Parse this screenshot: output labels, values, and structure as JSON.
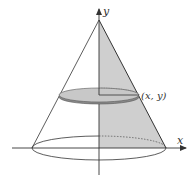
{
  "diagram": {
    "axes": {
      "x_label": "x",
      "y_label": "y"
    },
    "point_label": "(x, y)",
    "colors": {
      "stroke": "#333333",
      "shade": "#cfcfcf",
      "disk_fill": "#c8c8c8",
      "disk_edge": "#7a7a7a",
      "background": "#ffffff"
    },
    "geometry": {
      "apex": [
        99,
        20
      ],
      "base_center": [
        99,
        148
      ],
      "base_rx": 67,
      "base_ry": 12,
      "disk_center": [
        99,
        95
      ],
      "disk_rx": 40,
      "disk_ry": 7,
      "point": [
        139,
        95
      ]
    }
  }
}
